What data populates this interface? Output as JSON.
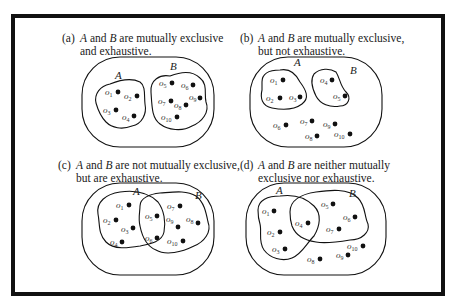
{
  "figure": {
    "panels": [
      {
        "id": "a",
        "tag": "(a)",
        "caption_line1_pre": "",
        "caption_line1": "and",
        "caption_line1_rest": "are mutually exclusive",
        "caption_line2": "and exhaustive.",
        "set_a_label": "A",
        "set_b_label": "B",
        "points": [
          {
            "label": "o",
            "sub": "1",
            "set": "A"
          },
          {
            "label": "o",
            "sub": "2",
            "set": "A"
          },
          {
            "label": "o",
            "sub": "3",
            "set": "A"
          },
          {
            "label": "o",
            "sub": "4",
            "set": "A"
          },
          {
            "label": "o",
            "sub": "5",
            "set": "B"
          },
          {
            "label": "o",
            "sub": "6",
            "set": "B"
          },
          {
            "label": "o",
            "sub": "7",
            "set": "B"
          },
          {
            "label": "o",
            "sub": "8",
            "set": "B"
          },
          {
            "label": "o",
            "sub": "9",
            "set": "B"
          },
          {
            "label": "o",
            "sub": "10",
            "set": "B"
          }
        ]
      },
      {
        "id": "b",
        "tag": "(b)",
        "caption_line1": "and",
        "caption_line1_rest": "are mutually exclusive,",
        "caption_line2": "but not exhaustive.",
        "set_a_label": "A",
        "set_b_label": "B",
        "points": [
          {
            "label": "o",
            "sub": "1",
            "set": "A"
          },
          {
            "label": "o",
            "sub": "2",
            "set": "A"
          },
          {
            "label": "o",
            "sub": "3",
            "set": "A"
          },
          {
            "label": "o",
            "sub": "4",
            "set": "B"
          },
          {
            "label": "o",
            "sub": "5",
            "set": "B"
          },
          {
            "label": "o",
            "sub": "6",
            "set": "none"
          },
          {
            "label": "o",
            "sub": "7",
            "set": "none"
          },
          {
            "label": "o",
            "sub": "8",
            "set": "none"
          },
          {
            "label": "o",
            "sub": "9",
            "set": "none"
          },
          {
            "label": "o",
            "sub": "10",
            "set": "none"
          }
        ]
      },
      {
        "id": "c",
        "tag": "(c)",
        "caption_line1": "and",
        "caption_line1_rest": "are not mutually exclusive,",
        "caption_line2": "but are exhaustive.",
        "set_a_label": "A",
        "set_b_label": "B",
        "points": [
          {
            "label": "o",
            "sub": "1",
            "set": "A"
          },
          {
            "label": "o",
            "sub": "2",
            "set": "A"
          },
          {
            "label": "o",
            "sub": "3",
            "set": "A"
          },
          {
            "label": "o",
            "sub": "4",
            "set": "A"
          },
          {
            "label": "o",
            "sub": "5",
            "set": "A∩B"
          },
          {
            "label": "o",
            "sub": "6",
            "set": "A∩B"
          },
          {
            "label": "o",
            "sub": "7",
            "set": "B"
          },
          {
            "label": "o",
            "sub": "8",
            "set": "B"
          },
          {
            "label": "o",
            "sub": "9",
            "set": "B"
          },
          {
            "label": "o",
            "sub": "10",
            "set": "B"
          }
        ]
      },
      {
        "id": "d",
        "tag": "(d)",
        "caption_line1": "and",
        "caption_line1_rest": "are neither mutually",
        "caption_line2": "exclusive nor exhaustive.",
        "set_a_label": "A",
        "set_b_label": "B",
        "points": [
          {
            "label": "o",
            "sub": "1",
            "set": "A"
          },
          {
            "label": "o",
            "sub": "2",
            "set": "A"
          },
          {
            "label": "o",
            "sub": "3",
            "set": "A"
          },
          {
            "label": "o",
            "sub": "4",
            "set": "A∩B"
          },
          {
            "label": "o",
            "sub": "5",
            "set": "B"
          },
          {
            "label": "o",
            "sub": "6",
            "set": "B"
          },
          {
            "label": "o",
            "sub": "7",
            "set": "B"
          },
          {
            "label": "o",
            "sub": "8",
            "set": "none"
          },
          {
            "label": "o",
            "sub": "9",
            "set": "none"
          },
          {
            "label": "o",
            "sub": "10",
            "set": "none"
          }
        ]
      }
    ],
    "colors": {
      "ink": "#111111",
      "background": "#ffffff"
    }
  }
}
